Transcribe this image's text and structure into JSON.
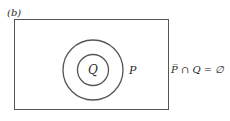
{
  "figure": {
    "label": "(b)",
    "sets": {
      "outer": "P",
      "inner": "Q"
    },
    "equation": "P̅ ∩ Q = ∅",
    "colors": {
      "stroke": "#555555",
      "text": "#2a2a2a",
      "background": "#ffffff"
    }
  }
}
